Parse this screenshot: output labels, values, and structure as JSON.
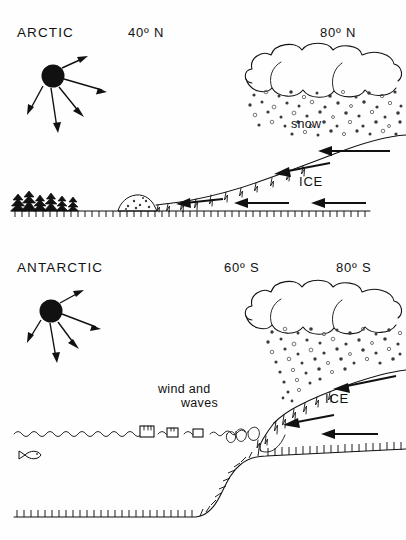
{
  "figure": {
    "width": 406,
    "height": 540,
    "background_color": "#ffffff",
    "ink_color": "#111111"
  },
  "panels": [
    {
      "id": "arctic",
      "region_label": "ARCTIC",
      "latitude_labels": [
        {
          "id": "arctic-lat-left",
          "text": "40º N"
        },
        {
          "id": "arctic-lat-right",
          "text": "80º N"
        }
      ],
      "precip_label": "snow",
      "ice_label": "ICE",
      "sun": {
        "name": "sun",
        "rays": 5
      },
      "features": [
        "forest",
        "moraine",
        "bedrock-hatched-ground",
        "crevassed-ice-slope",
        "cloud",
        "snow-stipple",
        "ice-flow-arrows"
      ],
      "flow_arrow_count": 6
    },
    {
      "id": "antarctic",
      "region_label": "ANTARCTIC",
      "latitude_labels": [
        {
          "id": "antarctic-lat-left",
          "text": "60º S"
        },
        {
          "id": "antarctic-lat-right",
          "text": "80º S"
        }
      ],
      "precip_label": "snow",
      "ice_label": "ICE",
      "ocean_label": "wind and",
      "ocean_label_2": "waves",
      "sun": {
        "name": "sun",
        "rays": 5
      },
      "features": [
        "sea-surface-waves",
        "icebergs",
        "fish",
        "calving-glacier-terminus",
        "seafloor-hatched",
        "cloud",
        "snow-stipple",
        "ice-flow-arrows"
      ],
      "iceberg_count": 3,
      "flow_arrow_count": 5
    }
  ],
  "icons": {
    "sun": "sun-icon",
    "cloud": "cloud-icon",
    "snow": "snow-stipple-icon",
    "tree": "conifer-tree-icon",
    "fish": "fish-icon",
    "iceberg": "iceberg-icon",
    "arrow": "flow-arrow-icon"
  }
}
